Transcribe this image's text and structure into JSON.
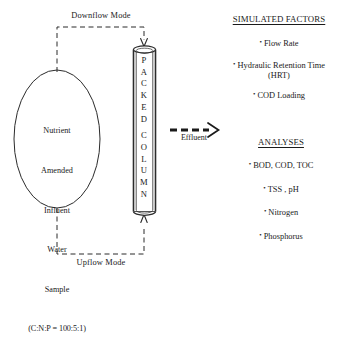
{
  "diagram": {
    "title_absent": true,
    "flow_labels": {
      "downflow": "Downflow Mode",
      "upflow": "Upflow Mode",
      "effluent": "Effluent"
    },
    "influent_tank": {
      "lines": [
        "Nutrient",
        "Amended",
        "Influent",
        "Water",
        "Sample"
      ],
      "ratio": "(C:N:P = 100:5:1)"
    },
    "column": {
      "label_top": "PACKED",
      "label_bottom": "COLUMN",
      "letters_top": [
        "P",
        "A",
        "C",
        "K",
        "E",
        "D"
      ],
      "letters_bottom": [
        "C",
        "O",
        "L",
        "U",
        "M",
        "N"
      ]
    },
    "simulated_factors": {
      "heading": "SIMULATED FACTORS",
      "items": [
        {
          "text": "Flow Rate",
          "sub": ""
        },
        {
          "text": "Hydraulic Retention Time",
          "sub": "(HRT)"
        },
        {
          "text": "COD Loading",
          "sub": ""
        }
      ]
    },
    "analyses": {
      "heading": "ANALYSES",
      "items": [
        {
          "text": "BOD, COD, TOC"
        },
        {
          "text": "TSS , pH"
        },
        {
          "text": "Nitrogen"
        },
        {
          "text": "Phosphorus"
        }
      ]
    },
    "bullet_glyph": "•",
    "colors": {
      "background": "#ffffff",
      "ink": "#1a1a1a",
      "line": "#2b2b2b"
    }
  }
}
